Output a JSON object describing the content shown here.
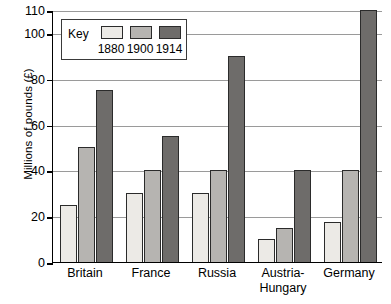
{
  "chart_data": {
    "type": "bar",
    "title": "",
    "xlabel": "",
    "ylabel": "Millions of pounds (£)",
    "categories": [
      "Britain",
      "France",
      "Russia",
      "Austria-\nHungary",
      "Germany"
    ],
    "series": [
      {
        "name": "1880",
        "values": [
          25,
          30,
          30,
          10,
          17.5
        ]
      },
      {
        "name": "1900",
        "values": [
          50,
          40,
          40,
          15,
          40
        ]
      },
      {
        "name": "1914",
        "values": [
          75,
          55,
          90,
          40,
          110
        ]
      }
    ],
    "ylim": [
      0,
      110
    ],
    "yticks": [
      0,
      20,
      40,
      60,
      80,
      100,
      110
    ],
    "ytick_labels": [
      "0",
      "20",
      "40",
      "60",
      "80",
      "100",
      "110"
    ],
    "grid": true,
    "legend_position": "top-left"
  },
  "legend": {
    "title": "Key",
    "entries": [
      {
        "year": "1880",
        "color": "#eceae6"
      },
      {
        "year": "1900",
        "color": "#b6b4b1"
      },
      {
        "year": "1914",
        "color": "#6e6c6a"
      }
    ]
  },
  "axis": {
    "y_title": "Millions of pounds (£)"
  },
  "colors": {
    "series_1880": "#eceae6",
    "series_1900": "#b6b4b1",
    "series_1914": "#6e6c6a",
    "axis": "#000000",
    "grid": "#9a9a9a",
    "bar_outline": "#2b2b2b",
    "background": "#ffffff"
  }
}
